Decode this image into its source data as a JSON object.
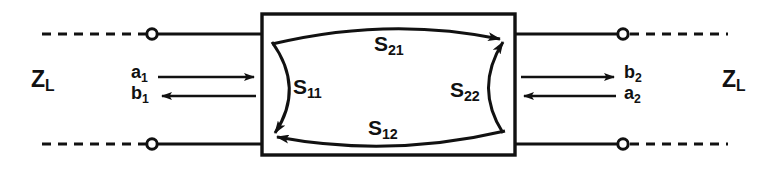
{
  "diagram": {
    "type": "s-parameter-two-port",
    "colors": {
      "line": "#111111",
      "background": "#ffffff"
    },
    "box": {
      "x": 262,
      "y": 14,
      "width": 253,
      "height": 141
    },
    "labels": {
      "zl_left": {
        "text": "Z",
        "sub": "L"
      },
      "zl_right": {
        "text": "Z",
        "sub": "L"
      },
      "s11": {
        "text": "S",
        "sub": "11"
      },
      "s21": {
        "text": "S",
        "sub": "21"
      },
      "s12": {
        "text": "S",
        "sub": "12"
      },
      "s22": {
        "text": "S",
        "sub": "22"
      },
      "a1": {
        "text": "a",
        "sub": "1"
      },
      "b1": {
        "text": "b",
        "sub": "1"
      },
      "b2": {
        "text": "b",
        "sub": "2"
      },
      "a2": {
        "text": "a",
        "sub": "2"
      }
    },
    "terminals": [
      {
        "name": "port1-top",
        "x": 152,
        "y": 34
      },
      {
        "name": "port1-bottom",
        "x": 152,
        "y": 144
      },
      {
        "name": "port2-top",
        "x": 623,
        "y": 34
      },
      {
        "name": "port2-bottom",
        "x": 623,
        "y": 144
      }
    ],
    "wave_arrows": [
      {
        "name": "a1",
        "direction": "right",
        "y": 77,
        "x1": 158,
        "x2": 258
      },
      {
        "name": "b1",
        "direction": "left",
        "y": 96,
        "x1": 158,
        "x2": 258
      },
      {
        "name": "b2",
        "direction": "right",
        "y": 77,
        "x1": 520,
        "x2": 618
      },
      {
        "name": "a2",
        "direction": "left",
        "y": 96,
        "x1": 520,
        "x2": 618
      }
    ],
    "s_arcs": [
      {
        "name": "S21",
        "from": "port1-top",
        "to": "port2-top",
        "direction": "left-to-right"
      },
      {
        "name": "S12",
        "from": "port2-bottom",
        "to": "port1-bottom",
        "direction": "right-to-left"
      },
      {
        "name": "S11",
        "from": "port1-top",
        "to": "port1-bottom",
        "direction": "reflection-left"
      },
      {
        "name": "S22",
        "from": "port2-bottom",
        "to": "port2-top",
        "direction": "reflection-right"
      }
    ]
  }
}
